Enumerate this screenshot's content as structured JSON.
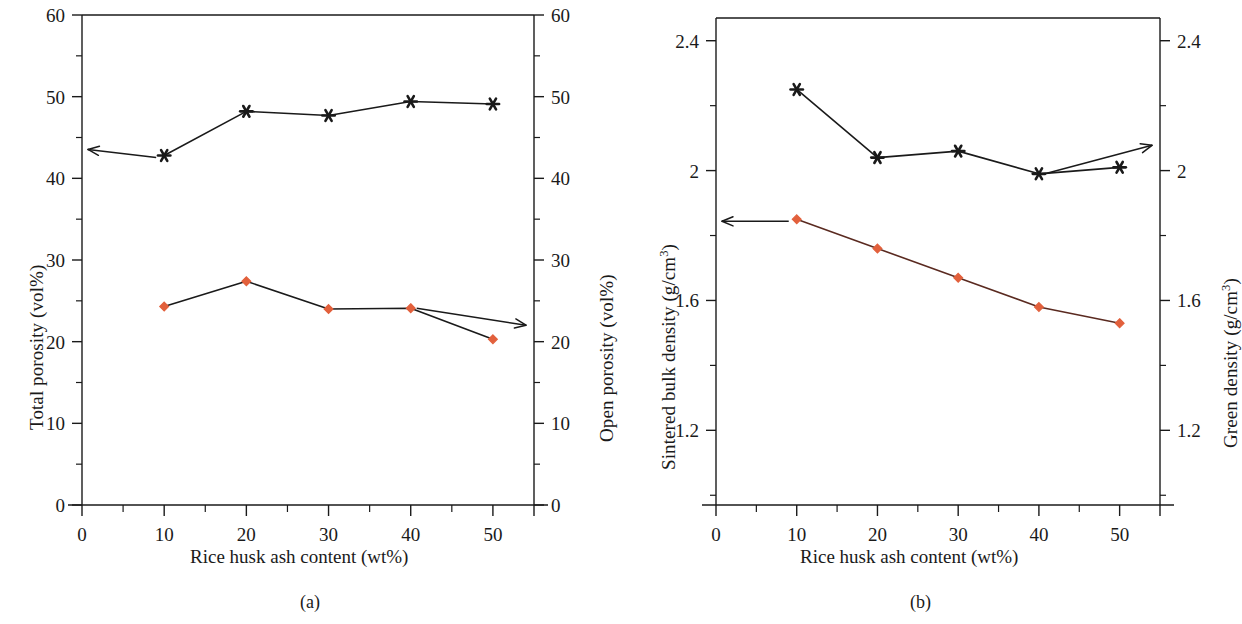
{
  "figure": {
    "xlabel": "Rice husk ash content (wt%)",
    "panels": [
      {
        "caption": "(a)",
        "left_axis_title": "Total porosity (vol%)",
        "right_axis_title": "Open porosity (vol%)",
        "xticklabels": [
          "0",
          "10",
          "20",
          "30",
          "40",
          "50"
        ],
        "left_yticklabels": [
          "0",
          "10",
          "20",
          "30",
          "40",
          "50",
          "60"
        ],
        "right_yticklabels": [
          "0",
          "10",
          "20",
          "30",
          "40",
          "50",
          "60"
        ]
      },
      {
        "caption": "(b)",
        "left_axis_title_main": "Sintered bulk density (g/cm",
        "left_axis_title_sup": "3",
        "left_axis_title_tail": ")",
        "right_axis_title_main": "Green density (g/cm",
        "right_axis_title_sup": "3",
        "right_axis_title_tail": ")",
        "xticklabels": [
          "0",
          "10",
          "20",
          "30",
          "40",
          "50"
        ],
        "left_yticklabels": [
          "1.2",
          "1.6",
          "2",
          "2.4"
        ],
        "right_yticklabels": [
          "1.2",
          "1.6",
          "2",
          "2.4"
        ]
      }
    ]
  },
  "colors": {
    "marker_red": "#e2603c",
    "line_red": "#5a2a20",
    "line_black": "#1a1a1a",
    "axis": "#1a1a1a",
    "background": "#ffffff"
  },
  "chart_data": [
    {
      "type": "line",
      "title": "(a)",
      "xlabel": "Rice husk ash content (wt%)",
      "ylabel": "Total porosity (vol%)",
      "y2label": "Open porosity (vol%)",
      "x": [
        10,
        20,
        30,
        40,
        50
      ],
      "xlim": [
        0,
        55
      ],
      "ylim": [
        0,
        60
      ],
      "y2lim": [
        0,
        60
      ],
      "xticks": [
        0,
        10,
        20,
        30,
        40,
        50
      ],
      "yticks": [
        0,
        10,
        20,
        30,
        40,
        50,
        60
      ],
      "y2ticks": [
        0,
        10,
        20,
        30,
        40,
        50,
        60
      ],
      "grid": false,
      "legend": "none",
      "series": [
        {
          "name": "Total porosity (vol%)",
          "axis": "left",
          "marker": "star",
          "color": "#1a1a1a",
          "values": [
            42.8,
            48.2,
            47.7,
            49.4,
            49.1
          ],
          "annotation": "arrow pointing left to left axis"
        },
        {
          "name": "Open porosity (vol%)",
          "axis": "right",
          "marker": "diamond",
          "color": "#e2603c",
          "values": [
            24.3,
            27.4,
            24.0,
            24.1,
            20.3
          ],
          "annotation": "arrow pointing right to right axis"
        }
      ]
    },
    {
      "type": "line",
      "title": "(b)",
      "xlabel": "Rice husk ash content (wt%)",
      "ylabel": "Sintered bulk density (g/cm3)",
      "y2label": "Green density (g/cm3)",
      "x": [
        10,
        20,
        30,
        40,
        50
      ],
      "xlim": [
        0,
        55
      ],
      "ylim": [
        0.97,
        2.47
      ],
      "y2lim": [
        0.97,
        2.47
      ],
      "xticks": [
        0,
        10,
        20,
        30,
        40,
        50
      ],
      "yticks": [
        1.2,
        1.6,
        2.0,
        2.4
      ],
      "y2ticks": [
        1.2,
        1.6,
        2.0,
        2.4
      ],
      "grid": false,
      "legend": "none",
      "series": [
        {
          "name": "Sintered bulk density (g/cm3)",
          "axis": "left",
          "marker": "diamond",
          "color": "#e2603c",
          "values": [
            1.85,
            1.76,
            1.67,
            1.58,
            1.53
          ],
          "annotation": "arrow pointing left to left axis"
        },
        {
          "name": "Green density (g/cm3)",
          "axis": "right",
          "marker": "star",
          "color": "#1a1a1a",
          "values": [
            2.25,
            2.04,
            2.06,
            1.99,
            2.01
          ],
          "annotation": "arrow pointing right to right axis"
        }
      ]
    }
  ]
}
